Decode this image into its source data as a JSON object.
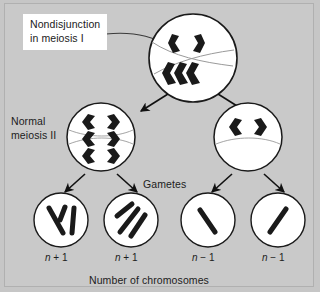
{
  "figure": {
    "title_label": "Nondisjunction\nin meiosis I",
    "normal_label": "Normal\nmeiosis II",
    "gametes_label": "Gametes",
    "bottom_caption": "Number of chromosomes",
    "background_color": "#c9c9c9",
    "cell_fill": "#ffffff",
    "chromosome_color": "#1a1a1a",
    "label_box_color": "#ffffff"
  },
  "cells": {
    "parent": {
      "name": "meiosis-i-cell",
      "chromosome_count_top": 2,
      "chromosome_count_bottom": 3,
      "note": "nondisjunction cluster"
    },
    "secondary_left": {
      "name": "secondary-cell-left",
      "chromosome_count": 3
    },
    "secondary_right": {
      "name": "secondary-cell-right",
      "chromosome_count": 1
    }
  },
  "gametes": [
    {
      "id": "gamete-1",
      "label_n": "n",
      "label_op": " + ",
      "label_num": "1",
      "chromosomes": 3
    },
    {
      "id": "gamete-2",
      "label_n": "n",
      "label_op": " + ",
      "label_num": "1",
      "chromosomes": 3
    },
    {
      "id": "gamete-3",
      "label_n": "n",
      "label_op": " − ",
      "label_num": "1",
      "chromosomes": 1
    },
    {
      "id": "gamete-4",
      "label_n": "n",
      "label_op": " − ",
      "label_num": "1",
      "chromosomes": 1
    }
  ]
}
